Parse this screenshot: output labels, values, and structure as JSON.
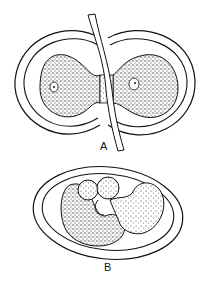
{
  "figure": {
    "panels": [
      {
        "id": "A",
        "label": "A",
        "description": "Two spherical cells with granular cytoplasm, each with a nucleus, connected by a conjugation bridge, enclosed by double membranes; a strand passes between them"
      },
      {
        "id": "B",
        "label": "B",
        "description": "Oval enclosure containing lobed granular mass (zygote / fused cells)"
      }
    ],
    "colors": {
      "ink": "#111111",
      "background": "#ffffff",
      "stipple": "#333333"
    }
  }
}
